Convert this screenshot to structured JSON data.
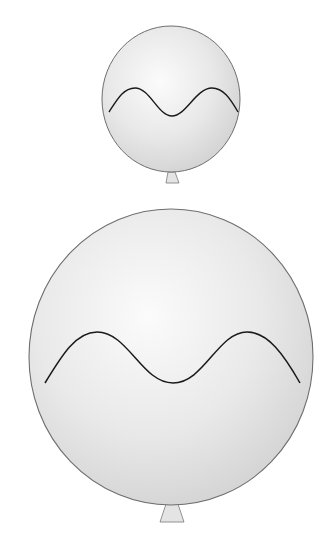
{
  "figure": {
    "colors": {
      "background": "#ffffff",
      "balloon_fill_light": "#f4f4f4",
      "balloon_fill_dark": "#d2d2d2",
      "balloon_outline": "#6e6e6e",
      "wave_stroke": "#1a1a1a",
      "knot_fill": "#e6e6e6"
    },
    "balloons": [
      {
        "name": "small-balloon",
        "center": [
          171,
          99
        ],
        "radius": [
          69,
          73
        ],
        "wave_points": [
          [
            109,
            112
          ],
          [
            135,
            88
          ],
          [
            172,
            116
          ],
          [
            212,
            88
          ],
          [
            238,
            112
          ]
        ]
      },
      {
        "name": "large-balloon",
        "center": [
          171,
          357
        ],
        "radius": [
          142,
          148
        ],
        "wave_points": [
          [
            45,
            383
          ],
          [
            97,
            332
          ],
          [
            173,
            383
          ],
          [
            247,
            332
          ],
          [
            300,
            383
          ]
        ]
      }
    ]
  }
}
